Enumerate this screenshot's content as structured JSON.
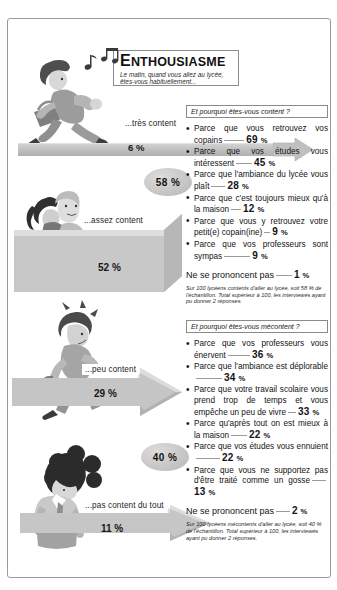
{
  "title": {
    "heading": "ENTHOUSIASME",
    "heading_first": "E",
    "heading_rest": "NTHOUSIASME",
    "subtitle": "Le matin, quand vous allez au lycée, êtes-vous habituellement..."
  },
  "levels": [
    {
      "id": "tres-content",
      "label": "...très content",
      "value": "6 %",
      "number": "6",
      "unit": "%"
    },
    {
      "id": "assez-content",
      "label": "...assez content",
      "value": "52 %",
      "number": "52",
      "unit": "%"
    },
    {
      "id": "peu-content",
      "label": "...peu content",
      "value": "29 %",
      "number": "29",
      "unit": "%"
    },
    {
      "id": "pas-content-du-tout",
      "label": "...pas content du tout",
      "value": "11 %",
      "number": "11",
      "unit": "%"
    }
  ],
  "groups": [
    {
      "id": "contents",
      "number": "58",
      "unit": "%",
      "value": "58 %"
    },
    {
      "id": "mecontents",
      "number": "40",
      "unit": "%",
      "value": "40 %"
    }
  ],
  "panels": [
    {
      "id": "content",
      "question": "Et pourquoi êtes-vous content ?",
      "items": [
        {
          "text": "Parce que vous retrouvez vos copains",
          "number": "69",
          "unit": "%"
        },
        {
          "text": "Parce que vos études vous intéressent",
          "number": "45",
          "unit": "%"
        },
        {
          "text": "Parce que l'ambiance du lycée vous plaît",
          "number": "28",
          "unit": "%"
        },
        {
          "text": "Parce que c'est toujours mieux qu'à la maison",
          "number": "12",
          "unit": "%"
        },
        {
          "text": "Parce que vous y retrouvez votre petit(e) copain(ine)",
          "number": "9",
          "unit": "%"
        },
        {
          "text": "Parce que vos professeurs sont sympas",
          "number": "9",
          "unit": "%"
        }
      ],
      "no_opinion_label": "Ne se prononcent pas",
      "no_opinion_number": "1",
      "no_opinion_unit": "%",
      "footnote": "Sur 100 lycéens contents d'aller au lycée, soit 58 % de l'échantillon. Total supérieur à 100, les interviewés ayant pu donner 2 réponses."
    },
    {
      "id": "mecontent",
      "question": "Et pourquoi êtes-vous mécontent ?",
      "items": [
        {
          "text": "Parce que vos professeurs vous énervent",
          "number": "36",
          "unit": "%"
        },
        {
          "text": "Parce que l'ambiance est déplorable",
          "number": "34",
          "unit": "%"
        },
        {
          "text": "Parce que votre travail scolaire vous prend trop de temps et vous empêche un peu de vivre",
          "number": "33",
          "unit": "%"
        },
        {
          "text": "Parce qu'après tout on est mieux à la maison",
          "number": "22",
          "unit": "%"
        },
        {
          "text": "Parce que vos études vous ennuient",
          "number": "22",
          "unit": "%"
        },
        {
          "text": "Parce que vous ne supportez pas d'être traité comme un gosse",
          "number": "13",
          "unit": "%"
        }
      ],
      "no_opinion_label": "Ne se prononcent pas",
      "no_opinion_number": "2",
      "no_opinion_unit": "%",
      "footnote": "Sur 100 lycéens mécontents d'aller au lycée, soit 40 % de l'échantillon. Total supérieur à 100, les interviewés ayant pu donner 2 réponses."
    }
  ],
  "illustrations": [
    {
      "id": "running-student-with-music-notes",
      "alt": "running-student-icon"
    },
    {
      "id": "two-students-walking",
      "alt": "two-students-icon"
    },
    {
      "id": "student-checking-watch",
      "alt": "student-watch-icon"
    },
    {
      "id": "student-head-down",
      "alt": "student-sad-icon"
    }
  ],
  "colors": {
    "band": "#c3c3c3",
    "ellipse": "#c6c6c6",
    "ink": "#131313",
    "rule": "#9c9c9c",
    "frame": "#8c8c8c",
    "paper": "#ffffff"
  }
}
